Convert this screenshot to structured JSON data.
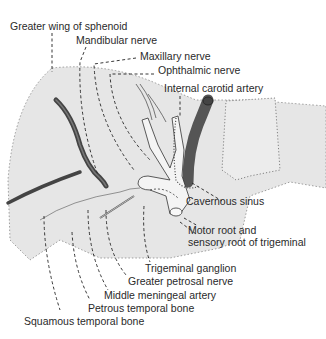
{
  "diagram": {
    "colors": {
      "bone_fill": "#e6e6e6",
      "vessel_dark": "#555555",
      "nerve_fill": "#f2f2f2",
      "outline": "#333333",
      "text": "#2a2a2a"
    },
    "labels": {
      "greater_wing": "Greater wing of sphenoid",
      "mandibular": "Mandibular nerve",
      "maxillary": "Maxillary nerve",
      "ophthalmic": "Ophthalmic nerve",
      "internal_carotid": "Internal carotid artery",
      "cavernous_sinus": "Cavernous sinus",
      "motor_root_1": "Motor root and",
      "motor_root_2": "sensory root of trigeminal",
      "trigeminal_ganglion": "Trigeminal ganglion",
      "greater_petrosal": "Greater petrosal nerve",
      "middle_meningeal": "Middle meningeal artery",
      "petrous_temporal": "Petrous temporal bone",
      "squamous_temporal": "Squamous temporal bone"
    }
  }
}
